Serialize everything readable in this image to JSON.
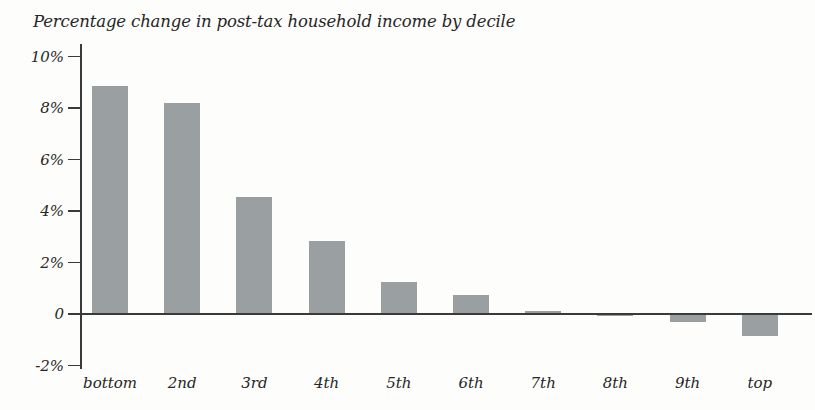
{
  "chart_data": {
    "type": "bar",
    "title": "Percentage change in post-tax household income by decile",
    "xlabel": "",
    "ylabel": "",
    "categories": [
      "bottom",
      "2nd",
      "3rd",
      "4th",
      "5th",
      "6th",
      "7th",
      "8th",
      "9th",
      "top"
    ],
    "values": [
      8.85,
      8.2,
      4.55,
      2.85,
      1.25,
      0.75,
      0.1,
      0.0,
      -0.3,
      -0.85
    ],
    "ylim": [
      -2,
      10
    ],
    "ytick_values": [
      10,
      8,
      6,
      4,
      2,
      0,
      -2
    ],
    "ytick_labels": [
      "10%",
      "8%",
      "6%",
      "4%",
      "2%",
      "0",
      "-2%"
    ],
    "grid": false,
    "legend": null,
    "bar_color": "#9a9fa1",
    "axis_color": "#3a3a3a",
    "background_color": "#fdfdfb",
    "units": "percent"
  }
}
